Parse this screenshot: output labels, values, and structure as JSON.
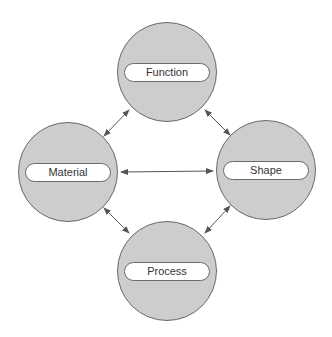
{
  "diagram": {
    "nodes": [
      {
        "id": "function",
        "label": "Function",
        "cx": 167,
        "cy": 72
      },
      {
        "id": "material",
        "label": "Material",
        "cx": 68,
        "cy": 172
      },
      {
        "id": "shape",
        "label": "Shape",
        "cx": 266,
        "cy": 170
      },
      {
        "id": "process",
        "label": "Process",
        "cx": 167,
        "cy": 271
      }
    ],
    "edges": [
      {
        "from": "function",
        "to": "material",
        "type": "bidirectional"
      },
      {
        "from": "function",
        "to": "shape",
        "type": "bidirectional"
      },
      {
        "from": "material",
        "to": "shape",
        "type": "bidirectional"
      },
      {
        "from": "material",
        "to": "process",
        "type": "bidirectional"
      },
      {
        "from": "shape",
        "to": "process",
        "type": "bidirectional"
      }
    ],
    "colors": {
      "node_fill": "#cdcdcd",
      "stroke": "#6a6a6a",
      "pill_fill": "#ffffff",
      "text": "#333333"
    }
  }
}
